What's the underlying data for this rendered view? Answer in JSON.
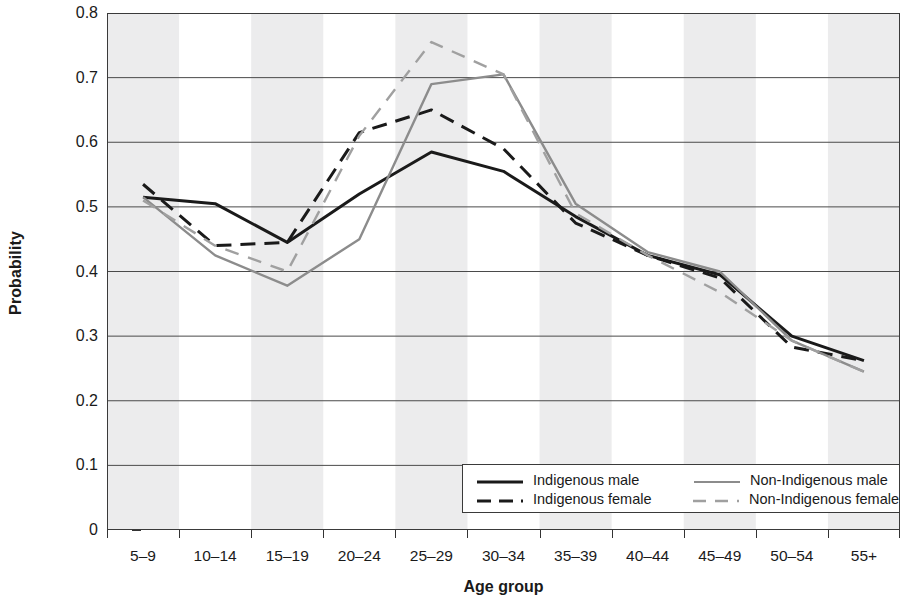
{
  "chart_data": {
    "type": "line",
    "title": "",
    "xlabel": "Age group",
    "ylabel": "Probability",
    "categories": [
      "5–9",
      "10–14",
      "15–19",
      "20–24",
      "25–29",
      "30–34",
      "35–39",
      "40–44",
      "45–49",
      "50–54",
      "55+"
    ],
    "ylim": [
      0,
      0.8
    ],
    "yticks": [
      "0",
      "0.1",
      "0.2",
      "0.3",
      "0.4",
      "0.5",
      "0.6",
      "0.7",
      "0.8"
    ],
    "ytick_values": [
      0,
      0.1,
      0.2,
      0.3,
      0.4,
      0.5,
      0.6,
      0.7,
      0.8
    ],
    "grid": "horizontal",
    "banding": "alternating vertical grey bands per category",
    "band_color": "#ececed",
    "legend_position": "bottom-right inside plot",
    "series": [
      {
        "name": "Indigenous male",
        "color": "#1a1a1a",
        "style": "solid",
        "values": [
          0.515,
          0.505,
          0.445,
          0.52,
          0.585,
          0.555,
          0.485,
          0.425,
          0.395,
          0.3,
          0.262
        ]
      },
      {
        "name": "Indigenous female",
        "color": "#1a1a1a",
        "style": "dashed",
        "values": [
          0.535,
          0.44,
          0.445,
          0.615,
          0.65,
          0.59,
          0.475,
          0.425,
          0.39,
          0.283,
          0.262
        ]
      },
      {
        "name": "Non-Indigenous male",
        "color": "#8c8c8c",
        "style": "solid",
        "values": [
          0.515,
          0.425,
          0.378,
          0.45,
          0.69,
          0.705,
          0.505,
          0.43,
          0.4,
          0.293,
          0.245
        ]
      },
      {
        "name": "Non-Indigenous female",
        "color": "#a0a0a0",
        "style": "dashed",
        "values": [
          0.51,
          0.44,
          0.4,
          0.61,
          0.755,
          0.705,
          0.49,
          0.425,
          0.368,
          0.293,
          0.245
        ]
      }
    ]
  },
  "legend": {
    "entries": [
      {
        "label": "Indigenous male"
      },
      {
        "label": "Non-Indigenous male"
      },
      {
        "label": "Indigenous female"
      },
      {
        "label": "Non-Indigenous female"
      }
    ]
  }
}
